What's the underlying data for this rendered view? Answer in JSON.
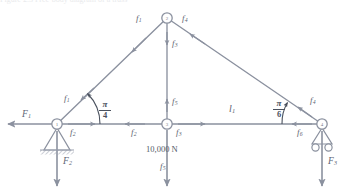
{
  "figure": {
    "kind": "truss-free-body-diagram",
    "caption_partial": "Figure 2.3  Free-body diagram of a truss",
    "stroke_color": "#8b919f",
    "text_color": "#5d6472",
    "background": "#ffffff"
  },
  "nodes": [
    {
      "id": "1",
      "label": "1",
      "x": 57,
      "y": 124,
      "support": "pin"
    },
    {
      "id": "2",
      "label": "2",
      "x": 167,
      "y": 18,
      "support": "none"
    },
    {
      "id": "3",
      "label": "3",
      "x": 167,
      "y": 124,
      "support": "none"
    },
    {
      "id": "4",
      "label": "4",
      "x": 322,
      "y": 124,
      "support": "roller"
    }
  ],
  "member_labels": {
    "f1": "f",
    "f1_sub": "1",
    "f2": "f",
    "f2_sub": "2",
    "f3": "f",
    "f3_sub": "3",
    "f4": "f",
    "f4_sub": "4",
    "f5": "f",
    "f5_sub": "5",
    "f6": "f",
    "f6_sub": "6"
  },
  "labels": {
    "f1_upper": {
      "base": "f",
      "sub": "1"
    },
    "f1_lower": {
      "base": "f",
      "sub": "1"
    },
    "f2_left": {
      "base": "f",
      "sub": "2"
    },
    "f2_center": {
      "base": "f",
      "sub": "2"
    },
    "f3_apex": {
      "base": "f",
      "sub": "3"
    },
    "f3_center": {
      "base": "f",
      "sub": "3"
    },
    "f4_upper": {
      "base": "f",
      "sub": "4"
    },
    "f4_lower": {
      "base": "f",
      "sub": "4"
    },
    "f5_mid": {
      "base": "f",
      "sub": "5"
    },
    "f5_bottom": {
      "base": "f",
      "sub": "5"
    },
    "f6_right": {
      "base": "f",
      "sub": "6"
    },
    "F1": {
      "base": "F",
      "sub": "1"
    },
    "F2": {
      "base": "F",
      "sub": "2"
    },
    "F3": {
      "base": "F",
      "sub": "3"
    },
    "l1": {
      "base": "l",
      "sub": "1"
    },
    "load": "10,000 N"
  },
  "angles": [
    {
      "name": "angle-left",
      "numerator": "π",
      "denominator": "4",
      "vertex_node": "1",
      "value_rad": 0.7853981634
    },
    {
      "name": "angle-right",
      "numerator": "π",
      "denominator": "6",
      "vertex_node": "4",
      "value_rad": 0.5235987756
    }
  ],
  "applied_loads": [
    {
      "name": "F1",
      "node": "1",
      "direction": "left",
      "label": "F₁"
    },
    {
      "name": "F2",
      "node": "1",
      "direction": "down",
      "label": "F₂"
    },
    {
      "name": "F3",
      "node": "4",
      "direction": "down",
      "label": "F₃"
    },
    {
      "name": "load-10000N",
      "node": "3",
      "direction": "down",
      "label": "10,000 N"
    }
  ]
}
